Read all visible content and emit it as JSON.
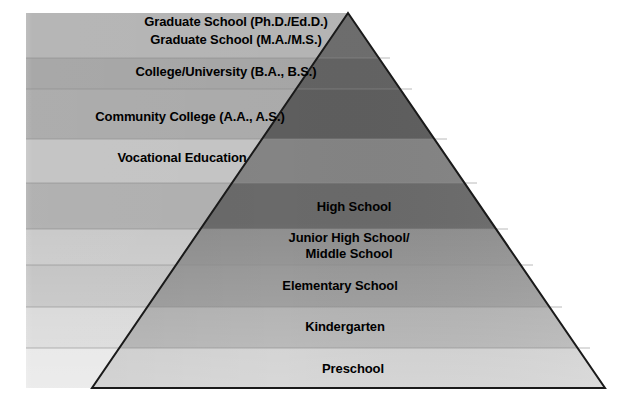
{
  "diagram": {
    "type": "pyramid",
    "orientation": "apex-top",
    "levels": [
      {
        "id": "graduate-doctoral",
        "label": "Graduate School (Ph.D./Ed.D.)",
        "order": 1,
        "band_color": "#b2b2b2",
        "pyramid_color": "#6e6e6e"
      },
      {
        "id": "graduate-masters",
        "label": "Graduate School (M.A./M.S.)",
        "order": 2,
        "band_color": "#b2b2b2",
        "pyramid_color": "#6e6e6e"
      },
      {
        "id": "college-university",
        "label": "College/University (B.A., B.S.)",
        "order": 3,
        "band_color": "#a3a3a3",
        "pyramid_color": "#636363"
      },
      {
        "id": "community-college",
        "label": "Community College (A.A., A.S.)",
        "order": 4,
        "band_color": "#a3a3a3",
        "pyramid_color": "#5e5e5e"
      },
      {
        "id": "vocational-education",
        "label": "Vocational Education",
        "order": 5,
        "band_color": "#c2c2c2",
        "pyramid_color": "#848484"
      },
      {
        "id": "high-school",
        "label": "High School",
        "order": 6,
        "band_color": "#adadad",
        "pyramid_color": "#6a6a6a"
      },
      {
        "id": "junior-high-middle-school",
        "label": "Junior High School/\nMiddle School",
        "order": 7,
        "band_color": "#c6c6c6",
        "pyramid_color": "#8e8e8e"
      },
      {
        "id": "elementary-school",
        "label": "Elementary School",
        "order": 8,
        "band_color": "#bdbdbd",
        "pyramid_color": "#919191"
      },
      {
        "id": "kindergarten",
        "label": "Kindergarten",
        "order": 9,
        "band_color": "#d2d2d2",
        "pyramid_color": "#a8a8a8"
      },
      {
        "id": "preschool",
        "label": "Preschool",
        "order": 10,
        "band_color": "#e2e2e2",
        "pyramid_color": "#c9c9c9"
      }
    ],
    "colors": {
      "outline": "#1a1a1a",
      "background": "#ffffff",
      "text": "#000000",
      "divider": "#8a8a8a"
    }
  }
}
